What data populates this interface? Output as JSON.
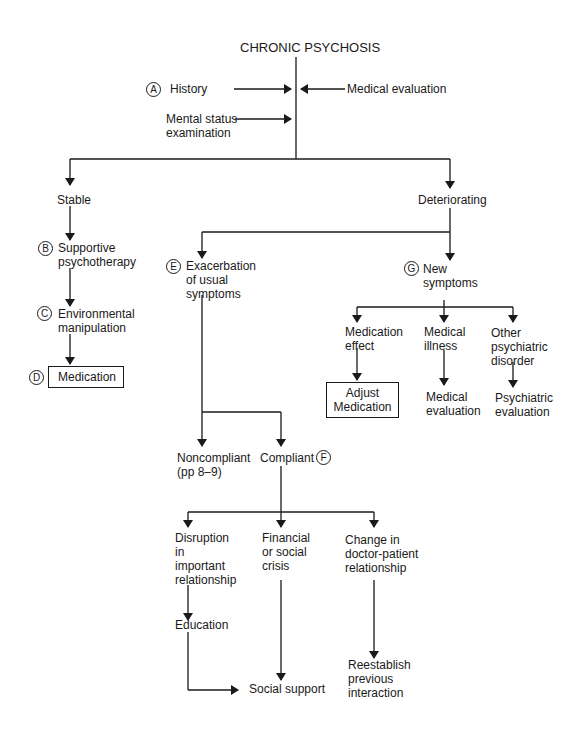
{
  "title": "CHRONIC PSYCHOSIS",
  "inputs": {
    "history": {
      "marker": "A",
      "label": "History"
    },
    "mental_status": {
      "label_line1": "Mental status",
      "label_line2": "examination"
    },
    "medical_evaluation": {
      "label": "Medical evaluation"
    }
  },
  "stable_branch": {
    "label": "Stable",
    "supportive": {
      "marker": "B",
      "line1": "Supportive",
      "line2": "psychotherapy"
    },
    "environmental": {
      "marker": "C",
      "line1": "Environmental",
      "line2": "manipulation"
    },
    "medication": {
      "marker": "D",
      "label": "Medication"
    }
  },
  "deteriorating_branch": {
    "label": "Deteriorating",
    "exacerbation": {
      "marker": "E",
      "line1": "Exacerbation",
      "line2": "of usual",
      "line3": "symptoms"
    },
    "noncompliant": {
      "line1": "Noncompliant",
      "line2": "(pp 8–9)"
    },
    "compliant": {
      "label": "Compliant",
      "marker": "F"
    },
    "disruption": {
      "line1": "Disruption",
      "line2": "in",
      "line3": "important",
      "line4": "relationship"
    },
    "financial": {
      "line1": "Financial",
      "line2": "or social",
      "line3": "crisis"
    },
    "change": {
      "line1": "Change in",
      "line2": "doctor-patient",
      "line3": "relationship"
    },
    "education": {
      "label": "Education"
    },
    "social_support": {
      "label": "Social support"
    },
    "reestablish": {
      "line1": "Reestablish",
      "line2": "previous",
      "line3": "interaction"
    },
    "new_symptoms": {
      "marker": "G",
      "line1": "New",
      "line2": "symptoms"
    },
    "medication_effect": {
      "line1": "Medication",
      "line2": "effect"
    },
    "adjust_medication": {
      "line1": "Adjust",
      "line2": "Medication"
    },
    "medical_illness": {
      "line1": "Medical",
      "line2": "illness"
    },
    "medical_eval2": {
      "line1": "Medical",
      "line2": "evaluation"
    },
    "other_disorder": {
      "line1": "Other",
      "line2": "psychiatric",
      "line3": "disorder"
    },
    "psychiatric_eval": {
      "line1": "Psychiatric",
      "line2": "evaluation"
    }
  }
}
